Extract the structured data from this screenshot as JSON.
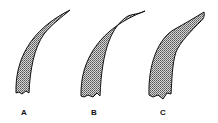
{
  "figure": {
    "panels": [
      {
        "label": "A",
        "shape": "slender-curved-claw",
        "label_x": 24,
        "label_y": 108
      },
      {
        "label": "B",
        "shape": "broad-curved-claw",
        "label_x": 94,
        "label_y": 108
      },
      {
        "label": "C",
        "shape": "stepped-tip-curved-claw",
        "label_x": 163,
        "label_y": 108
      }
    ],
    "fill_pattern": "stippled",
    "stroke_color": "#111111",
    "fill_color": "#9a9a9a"
  }
}
